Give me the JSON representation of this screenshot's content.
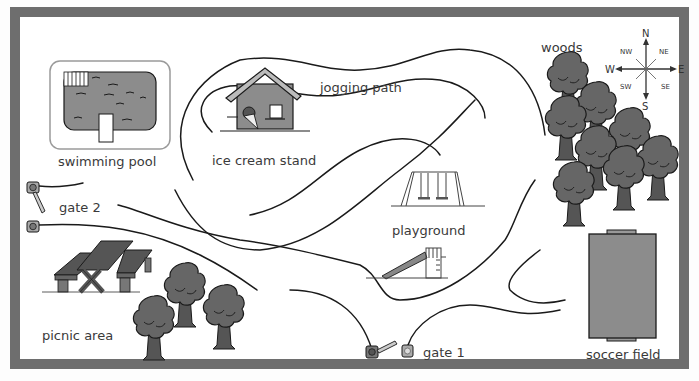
{
  "map": {
    "title": "Park Map",
    "colors": {
      "frame": "#6e6e6e",
      "background": "#ffffff",
      "fill_gray": "#8c8c8c",
      "dark_gray": "#5e5e5e",
      "tree": "#666666",
      "line": "#1a1a1a"
    },
    "locations": [
      {
        "id": "swimming-pool",
        "label": "swimming pool"
      },
      {
        "id": "ice-cream-stand",
        "label": "ice cream stand"
      },
      {
        "id": "jogging-path",
        "label": "jogging path"
      },
      {
        "id": "woods",
        "label": "woods"
      },
      {
        "id": "gate-2",
        "label": "gate 2"
      },
      {
        "id": "playground",
        "label": "playground"
      },
      {
        "id": "picnic-area",
        "label": "picnic area"
      },
      {
        "id": "gate-1",
        "label": "gate 1"
      },
      {
        "id": "soccer-field",
        "label": "soccer field"
      }
    ],
    "compass": {
      "n": "N",
      "ne": "NE",
      "e": "E",
      "se": "SE",
      "s": "S",
      "sw": "SW",
      "w": "W",
      "nw": "NW"
    }
  }
}
